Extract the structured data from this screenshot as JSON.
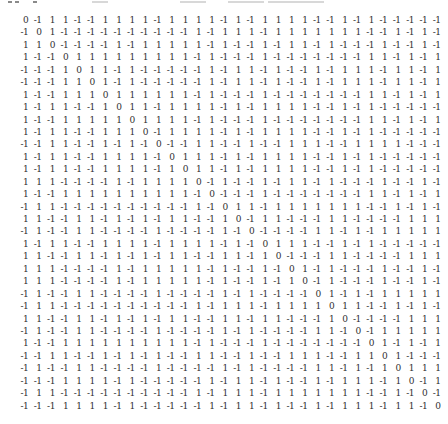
{
  "colors": {
    "background": "#ffffff",
    "text": "#2e2e2e",
    "artifact_dark": "#8a8a8a",
    "artifact_light": "#d8d8d8"
  },
  "top_artifact": {
    "description": "clipped bottom edge of previous text line",
    "marks": [
      {
        "x": 8,
        "w": 4,
        "tone": "dark"
      },
      {
        "x": 15,
        "w": 4,
        "tone": "dark"
      },
      {
        "x": 33,
        "w": 4,
        "tone": "dark"
      },
      {
        "x": 92,
        "w": 16,
        "tone": "light"
      },
      {
        "x": 180,
        "w": 26,
        "tone": "light"
      },
      {
        "x": 228,
        "w": 36,
        "tone": "light"
      },
      {
        "x": 268,
        "w": 56,
        "tone": "light"
      }
    ]
  },
  "matrix": {
    "size": 32,
    "rows": [
      [
        0,
        -1,
        1,
        1,
        -1,
        -1,
        1,
        1,
        1,
        1,
        -1,
        1,
        1,
        1,
        1,
        -1,
        1,
        -1,
        1,
        1,
        1,
        1,
        -1,
        -1,
        1,
        -1,
        1,
        -1,
        -1,
        -1,
        -1,
        -1
      ],
      [
        -1,
        0,
        1,
        -1,
        -1,
        -1,
        -1,
        -1,
        -1,
        -1,
        -1,
        -1,
        -1,
        1,
        -1,
        1,
        1,
        1,
        -1,
        1,
        1,
        1,
        1,
        1,
        1,
        1,
        -1,
        -1,
        1,
        -1,
        1,
        -1
      ],
      [
        1,
        1,
        0,
        -1,
        -1,
        -1,
        -1,
        1,
        -1,
        1,
        1,
        1,
        1,
        1,
        -1,
        1,
        -1,
        -1,
        1,
        -1,
        1,
        1,
        -1,
        1,
        -1,
        -1,
        -1,
        1,
        -1,
        -1,
        1,
        -1
      ],
      [
        1,
        -1,
        -1,
        0,
        1,
        1,
        1,
        1,
        1,
        1,
        1,
        1,
        1,
        -1,
        1,
        -1,
        -1,
        -1,
        1,
        -1,
        -1,
        -1,
        -1,
        -1,
        -1,
        -1,
        1,
        1,
        -1,
        1,
        -1,
        1
      ],
      [
        -1,
        -1,
        -1,
        1,
        0,
        1,
        1,
        -1,
        1,
        -1,
        -1,
        -1,
        -1,
        -1,
        1,
        -1,
        1,
        1,
        -1,
        1,
        -1,
        -1,
        1,
        -1,
        1,
        1,
        1,
        -1,
        1,
        1,
        -1,
        1
      ],
      [
        -1,
        -1,
        -1,
        1,
        1,
        0,
        1,
        -1,
        1,
        -1,
        -1,
        -1,
        -1,
        -1,
        1,
        -1,
        1,
        1,
        -1,
        1,
        -1,
        -1,
        1,
        -1,
        1,
        1,
        1,
        -1,
        1,
        1,
        -1,
        1
      ],
      [
        1,
        -1,
        -1,
        1,
        1,
        1,
        0,
        1,
        1,
        1,
        1,
        1,
        1,
        -1,
        1,
        -1,
        -1,
        -1,
        1,
        -1,
        -1,
        -1,
        -1,
        -1,
        -1,
        -1,
        1,
        1,
        -1,
        1,
        -1,
        1
      ],
      [
        1,
        -1,
        1,
        1,
        -1,
        -1,
        1,
        0,
        1,
        1,
        -1,
        1,
        1,
        1,
        1,
        -1,
        1,
        -1,
        1,
        1,
        1,
        1,
        -1,
        -1,
        1,
        -1,
        1,
        -1,
        -1,
        -1,
        -1,
        -1
      ],
      [
        1,
        -1,
        -1,
        1,
        1,
        1,
        1,
        1,
        0,
        1,
        1,
        1,
        1,
        -1,
        1,
        -1,
        -1,
        -1,
        1,
        -1,
        -1,
        -1,
        -1,
        -1,
        -1,
        -1,
        1,
        1,
        -1,
        1,
        -1,
        1
      ],
      [
        1,
        -1,
        1,
        1,
        -1,
        -1,
        1,
        1,
        1,
        0,
        -1,
        1,
        1,
        1,
        1,
        -1,
        1,
        -1,
        1,
        1,
        1,
        1,
        -1,
        -1,
        1,
        -1,
        1,
        -1,
        -1,
        -1,
        -1,
        -1
      ],
      [
        -1,
        -1,
        1,
        1,
        -1,
        -1,
        1,
        -1,
        1,
        -1,
        0,
        -1,
        -1,
        1,
        1,
        -1,
        -1,
        1,
        -1,
        -1,
        1,
        1,
        1,
        -1,
        -1,
        1,
        1,
        1,
        1,
        -1,
        -1,
        -1
      ],
      [
        1,
        -1,
        1,
        1,
        -1,
        -1,
        1,
        1,
        1,
        1,
        -1,
        0,
        1,
        1,
        1,
        -1,
        1,
        -1,
        1,
        1,
        1,
        1,
        -1,
        -1,
        1,
        -1,
        1,
        -1,
        -1,
        -1,
        -1,
        -1
      ],
      [
        1,
        -1,
        1,
        1,
        -1,
        -1,
        1,
        1,
        1,
        1,
        -1,
        1,
        0,
        1,
        1,
        -1,
        1,
        -1,
        1,
        1,
        1,
        1,
        -1,
        -1,
        1,
        -1,
        1,
        -1,
        -1,
        -1,
        -1,
        -1
      ],
      [
        1,
        1,
        1,
        -1,
        -1,
        -1,
        -1,
        1,
        -1,
        1,
        1,
        1,
        1,
        0,
        -1,
        1,
        -1,
        -1,
        1,
        -1,
        1,
        1,
        -1,
        1,
        -1,
        -1,
        -1,
        1,
        -1,
        -1,
        1,
        -1
      ],
      [
        1,
        -1,
        -1,
        1,
        1,
        1,
        1,
        1,
        1,
        1,
        1,
        1,
        1,
        -1,
        0,
        -1,
        -1,
        -1,
        1,
        -1,
        -1,
        -1,
        -1,
        -1,
        -1,
        -1,
        1,
        1,
        -1,
        1,
        -1,
        1
      ],
      [
        -1,
        1,
        1,
        -1,
        -1,
        -1,
        -1,
        -1,
        -1,
        -1,
        -1,
        -1,
        -1,
        1,
        -1,
        0,
        1,
        1,
        -1,
        1,
        1,
        1,
        1,
        1,
        1,
        1,
        -1,
        -1,
        1,
        -1,
        1,
        -1
      ],
      [
        1,
        1,
        -1,
        -1,
        1,
        1,
        -1,
        1,
        -1,
        1,
        -1,
        1,
        1,
        -1,
        -1,
        1,
        0,
        -1,
        1,
        1,
        -1,
        -1,
        -1,
        1,
        1,
        -1,
        -1,
        -1,
        -1,
        1,
        1,
        1
      ],
      [
        -1,
        1,
        -1,
        -1,
        1,
        1,
        -1,
        -1,
        -1,
        -1,
        1,
        -1,
        -1,
        -1,
        -1,
        1,
        -1,
        0,
        -1,
        -1,
        -1,
        -1,
        1,
        1,
        -1,
        1,
        -1,
        1,
        1,
        1,
        1,
        1
      ],
      [
        1,
        -1,
        1,
        1,
        -1,
        -1,
        1,
        1,
        1,
        1,
        -1,
        1,
        1,
        1,
        1,
        -1,
        1,
        -1,
        0,
        1,
        1,
        1,
        -1,
        -1,
        1,
        -1,
        1,
        -1,
        -1,
        -1,
        -1,
        -1
      ],
      [
        1,
        1,
        -1,
        -1,
        1,
        1,
        -1,
        1,
        -1,
        1,
        -1,
        1,
        1,
        -1,
        -1,
        1,
        1,
        -1,
        1,
        0,
        -1,
        -1,
        -1,
        1,
        1,
        -1,
        -1,
        -1,
        -1,
        1,
        1,
        1
      ],
      [
        1,
        1,
        1,
        -1,
        -1,
        -1,
        -1,
        1,
        -1,
        1,
        1,
        1,
        1,
        1,
        -1,
        1,
        -1,
        -1,
        1,
        -1,
        0,
        1,
        -1,
        1,
        -1,
        -1,
        -1,
        1,
        -1,
        -1,
        1,
        -1
      ],
      [
        1,
        1,
        1,
        -1,
        -1,
        -1,
        -1,
        1,
        -1,
        1,
        1,
        1,
        1,
        1,
        -1,
        1,
        -1,
        -1,
        1,
        -1,
        1,
        0,
        -1,
        1,
        -1,
        -1,
        -1,
        1,
        -1,
        -1,
        1,
        -1
      ],
      [
        -1,
        1,
        -1,
        -1,
        1,
        1,
        -1,
        -1,
        -1,
        -1,
        1,
        -1,
        -1,
        -1,
        -1,
        1,
        -1,
        1,
        -1,
        -1,
        -1,
        -1,
        0,
        1,
        -1,
        1,
        -1,
        1,
        1,
        1,
        1,
        1
      ],
      [
        -1,
        1,
        1,
        -1,
        -1,
        -1,
        -1,
        -1,
        -1,
        -1,
        -1,
        -1,
        -1,
        1,
        -1,
        1,
        1,
        1,
        -1,
        1,
        1,
        1,
        1,
        0,
        1,
        1,
        -1,
        -1,
        1,
        -1,
        1,
        -1
      ],
      [
        1,
        1,
        -1,
        -1,
        1,
        1,
        -1,
        1,
        -1,
        1,
        -1,
        1,
        1,
        -1,
        -1,
        1,
        1,
        -1,
        1,
        1,
        -1,
        -1,
        -1,
        1,
        0,
        -1,
        -1,
        -1,
        -1,
        1,
        1,
        1
      ],
      [
        -1,
        1,
        -1,
        -1,
        1,
        1,
        -1,
        -1,
        -1,
        -1,
        1,
        -1,
        -1,
        -1,
        -1,
        1,
        -1,
        1,
        -1,
        -1,
        -1,
        -1,
        1,
        1,
        -1,
        0,
        -1,
        1,
        1,
        1,
        1,
        1
      ],
      [
        1,
        -1,
        -1,
        1,
        1,
        1,
        1,
        1,
        1,
        1,
        1,
        1,
        1,
        -1,
        1,
        -1,
        -1,
        -1,
        1,
        -1,
        -1,
        -1,
        -1,
        -1,
        -1,
        -1,
        0,
        1,
        -1,
        1,
        -1,
        1
      ],
      [
        -1,
        -1,
        1,
        1,
        -1,
        -1,
        1,
        -1,
        1,
        -1,
        1,
        -1,
        -1,
        1,
        1,
        -1,
        -1,
        1,
        -1,
        -1,
        1,
        1,
        1,
        -1,
        -1,
        1,
        1,
        0,
        1,
        -1,
        -1,
        -1
      ],
      [
        -1,
        1,
        -1,
        -1,
        1,
        1,
        -1,
        -1,
        -1,
        -1,
        1,
        -1,
        -1,
        -1,
        -1,
        1,
        -1,
        1,
        -1,
        -1,
        -1,
        -1,
        1,
        1,
        -1,
        1,
        -1,
        1,
        0,
        1,
        1,
        1
      ],
      [
        -1,
        -1,
        -1,
        1,
        1,
        1,
        1,
        -1,
        1,
        -1,
        -1,
        -1,
        -1,
        -1,
        1,
        -1,
        1,
        1,
        -1,
        1,
        -1,
        -1,
        1,
        -1,
        1,
        1,
        1,
        -1,
        1,
        0,
        -1,
        1
      ],
      [
        -1,
        1,
        1,
        -1,
        -1,
        -1,
        -1,
        -1,
        -1,
        -1,
        -1,
        -1,
        -1,
        1,
        -1,
        1,
        1,
        1,
        -1,
        1,
        1,
        1,
        1,
        1,
        1,
        1,
        -1,
        -1,
        1,
        -1,
        0,
        -1
      ],
      [
        -1,
        -1,
        -1,
        1,
        1,
        1,
        1,
        -1,
        1,
        -1,
        -1,
        -1,
        -1,
        -1,
        1,
        -1,
        1,
        1,
        -1,
        1,
        -1,
        -1,
        1,
        -1,
        1,
        1,
        1,
        -1,
        1,
        1,
        -1,
        0
      ]
    ]
  }
}
